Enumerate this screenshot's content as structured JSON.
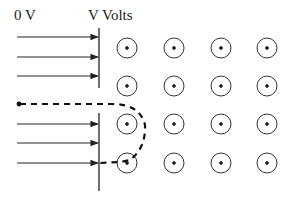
{
  "labels": {
    "left_potential": "0 V",
    "right_potential": "V Volts"
  },
  "field": {
    "direction": "out-of-page",
    "symbol": "circle-dot",
    "columns_x": [
      127,
      174,
      221,
      267
    ],
    "rows_y": [
      48,
      86,
      124,
      163
    ],
    "radius": 10
  },
  "electric_field_arrows": {
    "upper_y": [
      37,
      57,
      76
    ],
    "lower_y": [
      124,
      143,
      163
    ],
    "start_x": 17,
    "end_x": 99
  },
  "colors": {
    "stroke": "#222222",
    "background": "#ffffff"
  }
}
